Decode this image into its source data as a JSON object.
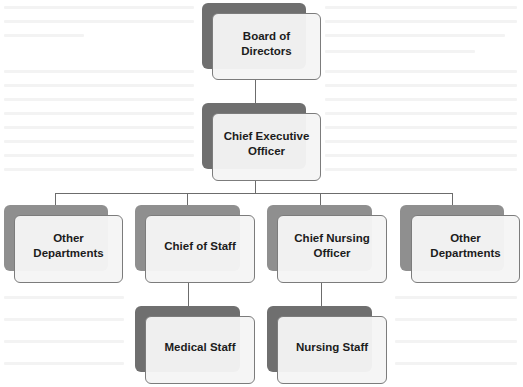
{
  "diagram": {
    "type": "org-chart",
    "colors": {
      "shadow_dark": "#6f6f6f",
      "shadow_light": "#8f8f8f",
      "box_fill": "#f5f5f5",
      "box_border": "#7c7c7c",
      "text": "#1c1c1c",
      "connector": "#6c6c6c"
    },
    "nodes": [
      {
        "id": "board",
        "label": "Board of Directors",
        "level": 0,
        "parent": null
      },
      {
        "id": "ceo",
        "label": "Chief Executive\nOfficer",
        "level": 1,
        "parent": "board"
      },
      {
        "id": "other1",
        "label": "Other\nDepartments",
        "level": 2,
        "parent": "ceo"
      },
      {
        "id": "cos",
        "label": "Chief of Staff",
        "level": 2,
        "parent": "ceo"
      },
      {
        "id": "cno",
        "label": "Chief Nursing Officer",
        "level": 2,
        "parent": "ceo"
      },
      {
        "id": "other2",
        "label": "Other Departments",
        "level": 2,
        "parent": "ceo"
      },
      {
        "id": "medical",
        "label": "Medical Staff",
        "level": 3,
        "parent": "cos"
      },
      {
        "id": "nursing",
        "label": "Nursing Staff",
        "level": 3,
        "parent": "cno"
      }
    ]
  }
}
